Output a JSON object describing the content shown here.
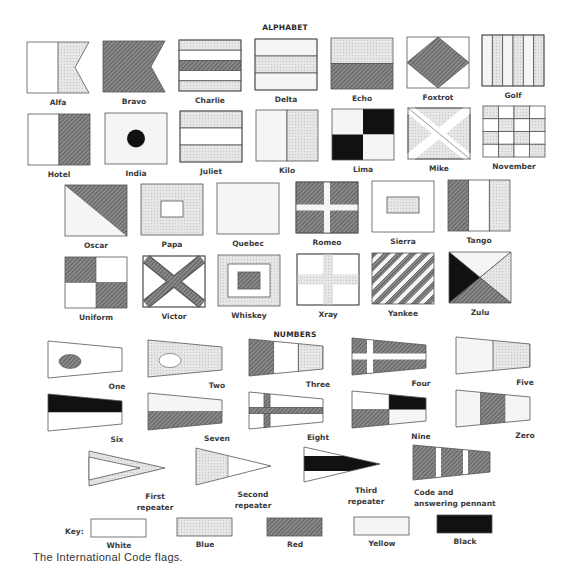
{
  "headings": {
    "alphabet": "ALPHABET",
    "numbers": "NUMBERS"
  },
  "palette": {
    "white": "#ffffff",
    "blue": "#e2e2e2",
    "red": "#7a7a7a",
    "yellow": "#f4f4f4",
    "black": "#111111",
    "outline": "#555555"
  },
  "alphabet": [
    {
      "letter": "A",
      "label": "Alfa",
      "design": "white hoist, blue fly, swallowtail"
    },
    {
      "letter": "B",
      "label": "Bravo",
      "design": "red, swallowtail"
    },
    {
      "letter": "C",
      "label": "Charlie",
      "design": "blue-white-red-white-blue horizontal"
    },
    {
      "letter": "D",
      "label": "Delta",
      "design": "yellow-blue-yellow horizontal"
    },
    {
      "letter": "E",
      "label": "Echo",
      "design": "blue over red"
    },
    {
      "letter": "F",
      "label": "Foxtrot",
      "design": "white with red diamond"
    },
    {
      "letter": "G",
      "label": "Golf",
      "design": "yellow and blue vertical stripes"
    },
    {
      "letter": "H",
      "label": "Hotel",
      "design": "white hoist, red fly"
    },
    {
      "letter": "I",
      "label": "India",
      "design": "yellow with black disc"
    },
    {
      "letter": "J",
      "label": "Juliet",
      "design": "blue-white-blue horizontal"
    },
    {
      "letter": "K",
      "label": "Kilo",
      "design": "yellow hoist, blue fly"
    },
    {
      "letter": "L",
      "label": "Lima",
      "design": "yellow/black quarters"
    },
    {
      "letter": "M",
      "label": "Mike",
      "design": "blue with white saltire"
    },
    {
      "letter": "N",
      "label": "November",
      "design": "blue and white checkers"
    },
    {
      "letter": "O",
      "label": "Oscar",
      "design": "red over yellow diagonal"
    },
    {
      "letter": "P",
      "label": "Papa",
      "design": "blue with white center"
    },
    {
      "letter": "Q",
      "label": "Quebec",
      "design": "yellow"
    },
    {
      "letter": "R",
      "label": "Romeo",
      "design": "red with yellow cross"
    },
    {
      "letter": "S",
      "label": "Sierra",
      "design": "white with blue center"
    },
    {
      "letter": "T",
      "label": "Tango",
      "design": "red-white-blue vertical"
    },
    {
      "letter": "U",
      "label": "Uniform",
      "design": "red/white quarters"
    },
    {
      "letter": "V",
      "label": "Victor",
      "design": "white with red saltire"
    },
    {
      "letter": "W",
      "label": "Whiskey",
      "design": "blue border, white, red center"
    },
    {
      "letter": "X",
      "label": "Xray",
      "design": "white with blue cross"
    },
    {
      "letter": "Y",
      "label": "Yankee",
      "design": "red and yellow diagonal stripes"
    },
    {
      "letter": "Z",
      "label": "Zulu",
      "design": "yellow/blue/red/black triangles"
    }
  ],
  "numbers": [
    {
      "label": "One"
    },
    {
      "label": "Two"
    },
    {
      "label": "Three"
    },
    {
      "label": "Four"
    },
    {
      "label": "Five"
    },
    {
      "label": "Six"
    },
    {
      "label": "Seven"
    },
    {
      "label": "Eight"
    },
    {
      "label": "Nine"
    },
    {
      "label": "Zero"
    }
  ],
  "substitutes": [
    {
      "label_lines": [
        "First",
        "repeater"
      ]
    },
    {
      "label_lines": [
        "Second",
        "repeater"
      ]
    },
    {
      "label_lines": [
        "Third",
        "repeater"
      ]
    },
    {
      "label_lines": [
        "Code and",
        "answering pennant"
      ]
    }
  ],
  "key": {
    "title": "Key:",
    "items": [
      {
        "label": "White",
        "color": "white"
      },
      {
        "label": "Blue",
        "color": "blue"
      },
      {
        "label": "Red",
        "color": "red"
      },
      {
        "label": "Yellow",
        "color": "yellow"
      },
      {
        "label": "Black",
        "color": "black"
      }
    ]
  },
  "caption": "The International Code flags."
}
